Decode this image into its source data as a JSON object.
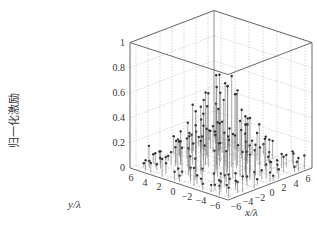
{
  "chart_data": {
    "type": "scatter",
    "subtype": "3d-stem",
    "title": "",
    "xlabel": "x/λ",
    "ylabel": "y/λ",
    "zlabel": "归一化激励",
    "x_ticks": [
      "-6",
      "-4",
      "-2",
      "0",
      "2",
      "4",
      "6"
    ],
    "y_ticks": [
      "-6",
      "-4",
      "-2",
      "0",
      "2",
      "4",
      "6"
    ],
    "z_ticks": [
      "0",
      "0.2",
      "0.4",
      "0.6",
      "0.8",
      "1"
    ],
    "xlim": [
      -7,
      7
    ],
    "ylim": [
      -7,
      7
    ],
    "zlim": [
      0,
      1
    ],
    "grid": true
  },
  "colors": {
    "axis": "#444444",
    "grid": "#aaaaaa",
    "stem": "#555555",
    "marker": "#333333"
  }
}
